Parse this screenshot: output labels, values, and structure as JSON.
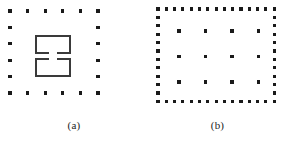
{
  "figure": {
    "background_color": "#ffffff",
    "dot_color": "#1a1a1a",
    "stroke_color": "#3a3a3a",
    "caption_color": "#1d1d1d",
    "clipped_footer_text": ""
  },
  "panels": [
    {
      "id": "a",
      "caption": "(a)",
      "description": "sparse square ring of dots enclosing two stacked open rectangles",
      "dot_layout": {
        "type": "hollow-ring",
        "columns": 6,
        "rows": 6,
        "origin_x": 10,
        "origin_y": 11,
        "step_x": 17.6,
        "step_y": 16.4,
        "dot_size": 3.2
      },
      "shapes": [
        {
          "name": "upper-open-rectangle",
          "x": 35,
          "y": 35,
          "width": 36,
          "height": 19,
          "stroke_width": 1.6,
          "gap_edge": "bottom",
          "gap_width": 8
        },
        {
          "name": "lower-open-rectangle",
          "x": 35,
          "y": 58,
          "width": 36,
          "height": 19,
          "stroke_width": 1.6,
          "gap_edge": "top",
          "gap_width": 8
        }
      ]
    },
    {
      "id": "b",
      "caption": "(b)",
      "description": "dense dotted border enclosing a sparse 4 by 3 interior dot grid",
      "border_layout": {
        "type": "dense-perimeter",
        "columns": 15,
        "rows": 12,
        "origin_x": 10,
        "origin_y": 9,
        "step_x": 8.3,
        "step_y": 8.4,
        "dot_size": 3.2
      },
      "interior_layout": {
        "type": "grid",
        "columns": 4,
        "rows": 3,
        "origin_x": 31,
        "origin_y": 31,
        "step_x": 26.5,
        "step_y": 25.5,
        "dot_size": 3.6
      }
    }
  ]
}
